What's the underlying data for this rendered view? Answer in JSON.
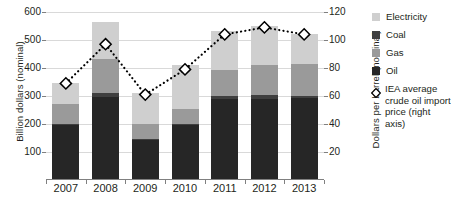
{
  "chart_data": {
    "type": "bar",
    "title": "",
    "subtitle": "",
    "categories": [
      "2007",
      "2008",
      "2009",
      "2010",
      "2011",
      "2012",
      "2013"
    ],
    "xlabel": "",
    "ylabel": "Billion dollars (nominal)",
    "ylabel_right": "Dollars per barrel (nominal)",
    "ylim": [
      0,
      600
    ],
    "ylim_right": [
      0,
      120
    ],
    "yticks": [
      100,
      200,
      300,
      400,
      500,
      600
    ],
    "yticks_right": [
      20,
      40,
      60,
      80,
      100,
      120
    ],
    "grid": true,
    "stacked": true,
    "legend_position": "right",
    "series": [
      {
        "name": "Oil",
        "color": "#262626",
        "values": [
          196,
          298,
          145,
          196,
          288,
          290,
          292
        ]
      },
      {
        "name": "Coal",
        "color": "#3f3f3f",
        "values": [
          4,
          14,
          3,
          4,
          12,
          12,
          8
        ]
      },
      {
        "name": "Gas",
        "color": "#9a9a9a",
        "values": [
          72,
          120,
          53,
          52,
          92,
          110,
          116
        ]
      },
      {
        "name": "Electricity",
        "color": "#cfcfcf",
        "values": [
          74,
          133,
          109,
          159,
          139,
          139,
          104
        ]
      }
    ],
    "line_series": {
      "name": "IEA average crude oil import price (right axis)",
      "marker": "diamond",
      "axis": "right",
      "color": "#000000",
      "values": [
        69,
        97,
        61,
        79,
        104,
        109,
        104
      ]
    }
  },
  "axes": {
    "left": {
      "title": "Billion dollars (nominal)",
      "ticks": [
        "600",
        "500",
        "400",
        "300",
        "200",
        "100"
      ]
    },
    "right": {
      "title": "Dollars per barrel (nominal)",
      "ticks": [
        "120",
        "100",
        "80",
        "60",
        "40",
        "20"
      ]
    },
    "categories": [
      "2007",
      "2008",
      "2009",
      "2010",
      "2011",
      "2012",
      "2013"
    ]
  },
  "legend": {
    "items": [
      {
        "label": "Electricity",
        "marker": "square",
        "color": "#cfcfcf"
      },
      {
        "label": "Coal",
        "marker": "square",
        "color": "#3f3f3f"
      },
      {
        "label": "Gas",
        "marker": "square",
        "color": "#9a9a9a"
      },
      {
        "label": "Oil",
        "marker": "square",
        "color": "#262626"
      },
      {
        "label": "IEA average crude oil import price (right axis)",
        "marker": "diamond",
        "color": "#000000"
      }
    ]
  }
}
